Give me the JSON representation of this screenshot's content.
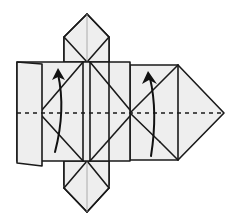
{
  "diagram": {
    "type": "origami-fold-step",
    "description": "Origami folding step: valley fold along horizontal dashed line, lifting bottom half upward (two curved arrows)",
    "colors": {
      "paper": "#eeeeee",
      "line": "#1a1a1a",
      "background": "#ffffff"
    },
    "elements": {
      "valley_fold_line": "horizontal dashed line",
      "arrows": [
        {
          "name": "left-fold-arrow",
          "direction": "up"
        },
        {
          "name": "right-fold-arrow",
          "direction": "up"
        }
      ],
      "flaps": [
        "top-diamond-flap",
        "bottom-diamond-flap",
        "left-flap",
        "right-point"
      ]
    }
  }
}
